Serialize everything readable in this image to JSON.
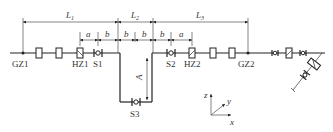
{
  "diagram": {
    "type": "piping isometric layout",
    "labels": {
      "gz1": "GZ1",
      "hz1": "HZ1",
      "s1": "S1",
      "s2": "S2",
      "hz2": "HZ2",
      "gz2": "GZ2",
      "s3": "S3"
    },
    "dimensions": {
      "l1": "L",
      "l1_sub": "1",
      "l2": "L",
      "l2_sub": "2",
      "l3": "L",
      "l3_sub": "3",
      "a_left": "a",
      "b1": "b",
      "b2": "b",
      "b3": "b",
      "b4": "b",
      "a_right": "a",
      "vertical": "A"
    },
    "axes": {
      "z": "z",
      "y": "y",
      "x": "x"
    }
  }
}
